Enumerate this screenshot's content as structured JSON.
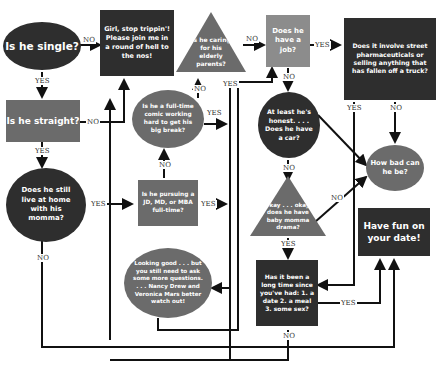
{
  "nodes": {
    "single": "Is he single?",
    "stop": "Girl, stop trippin'! Please join me in a round of hell to the nos!",
    "elderly": "Is he caring for his elderly parents?",
    "job": "Does he have a job?",
    "street": "Does it involve street pharmaceuticals or selling anything that has fallen off a truck?",
    "straight": "Is he straight?",
    "comic": "Is he a full-time comic working hard to get his big break?",
    "honest": "At least he's honest. . . . Does he have a car?",
    "howbad": "How bad can he be?",
    "momma": "Does he still live at home with his momma?",
    "jd": "Is he pursuing a JD, MD, or MBA full-time?",
    "babymomma": "Okay . . . okay, does he have baby momma drama?",
    "funDate": "Have fun on your date!",
    "looking": "Looking good . . . but you still need to ask some more questions. . . . Nancy Drew and Veronica Mars better watch out!",
    "longtime": "Has it been a long time since you've had: 1. a date 2. a meal 3. some sex?"
  },
  "labels": {
    "yes": "YES",
    "no": "NO"
  },
  "colors": {
    "dark": "#2e2e2e",
    "mid": "#6b6b6b",
    "light": "#8c8c8c",
    "line": "#111111"
  }
}
